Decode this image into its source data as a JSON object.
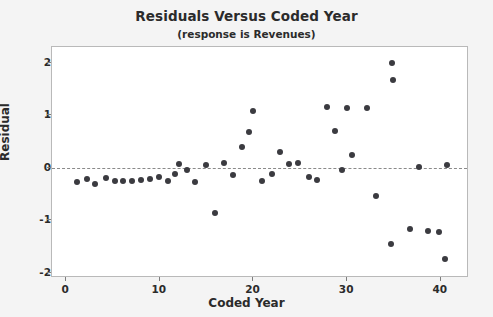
{
  "chart_data": {
    "type": "scatter",
    "title": "Residuals Versus Coded Year",
    "subtitle": "(response is Revenues)",
    "xlabel": "Coded Year",
    "ylabel": "Residual",
    "xlim": [
      -1.5,
      43
    ],
    "ylim": [
      -2.1,
      2.3
    ],
    "xticks": [
      0,
      10,
      20,
      30,
      40
    ],
    "yticks": [
      2,
      1,
      0,
      -1,
      -2
    ],
    "grid": false,
    "legend": null,
    "reference_line": {
      "orientation": "horizontal",
      "value": 0,
      "style": "dashed"
    },
    "marker": {
      "shape": "circle",
      "color": "#3b3b40",
      "size": 6
    },
    "points": [
      {
        "x": 1.2,
        "y": -0.28
      },
      {
        "x": 2.2,
        "y": -0.22
      },
      {
        "x": 3.1,
        "y": -0.3
      },
      {
        "x": 4.3,
        "y": -0.2
      },
      {
        "x": 5.2,
        "y": -0.26
      },
      {
        "x": 6.1,
        "y": -0.26
      },
      {
        "x": 7.0,
        "y": -0.26
      },
      {
        "x": 8.0,
        "y": -0.24
      },
      {
        "x": 9.0,
        "y": -0.22
      },
      {
        "x": 9.9,
        "y": -0.18
      },
      {
        "x": 10.9,
        "y": -0.26
      },
      {
        "x": 12.0,
        "y": 0.08
      },
      {
        "x": 12.9,
        "y": -0.04
      },
      {
        "x": 13.8,
        "y": -0.28
      },
      {
        "x": 14.9,
        "y": 0.06
      },
      {
        "x": 15.9,
        "y": -0.86
      },
      {
        "x": 16.9,
        "y": 0.1
      },
      {
        "x": 18.8,
        "y": 0.4
      },
      {
        "x": 19.5,
        "y": 0.68
      },
      {
        "x": 19.9,
        "y": 1.08
      },
      {
        "x": 20.9,
        "y": -0.26
      },
      {
        "x": 22.0,
        "y": -0.12
      },
      {
        "x": 22.8,
        "y": 0.3
      },
      {
        "x": 23.8,
        "y": 0.08
      },
      {
        "x": 24.8,
        "y": 0.1
      },
      {
        "x": 25.9,
        "y": -0.18
      },
      {
        "x": 26.8,
        "y": -0.24
      },
      {
        "x": 28.7,
        "y": 0.7
      },
      {
        "x": 27.8,
        "y": 1.16
      },
      {
        "x": 29.5,
        "y": -0.04
      },
      {
        "x": 30.5,
        "y": 0.24
      },
      {
        "x": 32.1,
        "y": 1.14
      },
      {
        "x": 30.0,
        "y": 1.14
      },
      {
        "x": 33.1,
        "y": -0.54
      },
      {
        "x": 34.7,
        "y": -1.46
      },
      {
        "x": 34.8,
        "y": 2.0
      },
      {
        "x": 34.9,
        "y": 1.68
      },
      {
        "x": 36.7,
        "y": -1.16
      },
      {
        "x": 37.7,
        "y": 0.02
      },
      {
        "x": 38.6,
        "y": -1.2
      },
      {
        "x": 40.6,
        "y": 0.06
      },
      {
        "x": 39.8,
        "y": -1.22
      },
      {
        "x": 40.4,
        "y": -1.74
      },
      {
        "x": 17.8,
        "y": -0.14
      },
      {
        "x": 11.6,
        "y": -0.12
      }
    ]
  }
}
